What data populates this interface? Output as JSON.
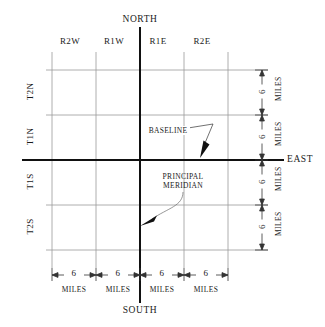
{
  "diagram": {
    "cardinals": {
      "north": "NORTH",
      "south": "SOUTH",
      "east": "EAST"
    },
    "range_labels": [
      {
        "text": "R2W",
        "x": 70
      },
      {
        "text": "R1W",
        "x": 114
      },
      {
        "text": "R1E",
        "x": 158
      },
      {
        "text": "R2E",
        "x": 202
      }
    ],
    "township_labels": [
      {
        "text": "T2N",
        "y": 92
      },
      {
        "text": "T1N",
        "y": 137
      },
      {
        "text": "T1S",
        "y": 182
      },
      {
        "text": "T2S",
        "y": 227
      }
    ],
    "bottom_dimensions": [
      {
        "value": "6",
        "unit": "MILES",
        "x": 74
      },
      {
        "value": "6",
        "unit": "MILES",
        "x": 118
      },
      {
        "value": "6",
        "unit": "MILES",
        "x": 162
      },
      {
        "value": "6",
        "unit": "MILES",
        "x": 206
      }
    ],
    "right_dimensions": [
      {
        "value": "6",
        "unit": "MILES",
        "y": 92
      },
      {
        "value": "6",
        "unit": "MILES",
        "y": 137
      },
      {
        "value": "6",
        "unit": "MILES",
        "y": 182
      },
      {
        "value": "6",
        "unit": "MILES",
        "y": 227
      }
    ],
    "annotations": {
      "baseline": "BASELINE",
      "principal_meridian_line1": "PRINCIPAL",
      "principal_meridian_line2": "MERIDIAN"
    },
    "colors": {
      "grid_line": "#9a9a9a",
      "axis_line": "#111111",
      "text": "#1a1a1a",
      "dimension_line": "#333333",
      "background": "#ffffff"
    },
    "geometry": {
      "grid_x": [
        52,
        96,
        140,
        184,
        228
      ],
      "grid_y": [
        70,
        115,
        160,
        205,
        250
      ],
      "meridian_x": 140,
      "baseline_y": 160,
      "left_edge": 46,
      "right_dim_x": 262,
      "bottom_dim_y": 275
    }
  }
}
